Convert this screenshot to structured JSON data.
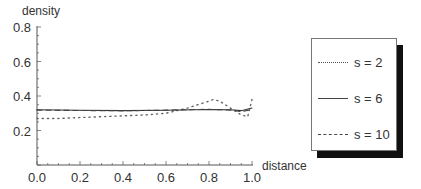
{
  "chart_data": {
    "type": "line",
    "title": "",
    "xlabel": "distance",
    "ylabel": "density",
    "xlim": [
      0.0,
      1.0
    ],
    "ylim": [
      0.0,
      0.8
    ],
    "xticks": [
      "0.0",
      "0.2",
      "0.4",
      "0.6",
      "0.8",
      "1.0"
    ],
    "yticks": [
      "0.2",
      "0.4",
      "0.6",
      "0.8"
    ],
    "grid": false,
    "legend_position": "right",
    "series": [
      {
        "name": "s = 2",
        "style": "dotted",
        "x": [
          0.0,
          0.1,
          0.2,
          0.3,
          0.4,
          0.5,
          0.6,
          0.7,
          0.75,
          0.8,
          0.82,
          0.85,
          0.9,
          0.95,
          0.98,
          1.0
        ],
        "y": [
          0.27,
          0.27,
          0.275,
          0.28,
          0.285,
          0.29,
          0.3,
          0.33,
          0.35,
          0.37,
          0.38,
          0.37,
          0.33,
          0.29,
          0.28,
          0.38
        ]
      },
      {
        "name": "s = 6",
        "style": "solid",
        "x": [
          0.0,
          0.2,
          0.4,
          0.6,
          0.8,
          0.9,
          0.95,
          1.0
        ],
        "y": [
          0.32,
          0.317,
          0.315,
          0.317,
          0.322,
          0.32,
          0.315,
          0.33
        ]
      },
      {
        "name": "s = 10",
        "style": "dashed",
        "x": [
          0.0,
          0.2,
          0.4,
          0.6,
          0.8,
          0.9,
          0.95,
          1.0
        ],
        "y": [
          0.318,
          0.316,
          0.314,
          0.318,
          0.323,
          0.318,
          0.31,
          0.32
        ]
      }
    ]
  },
  "legend": {
    "items": [
      {
        "label": "s = 2"
      },
      {
        "label": "s = 6"
      },
      {
        "label": "s = 10"
      }
    ]
  }
}
